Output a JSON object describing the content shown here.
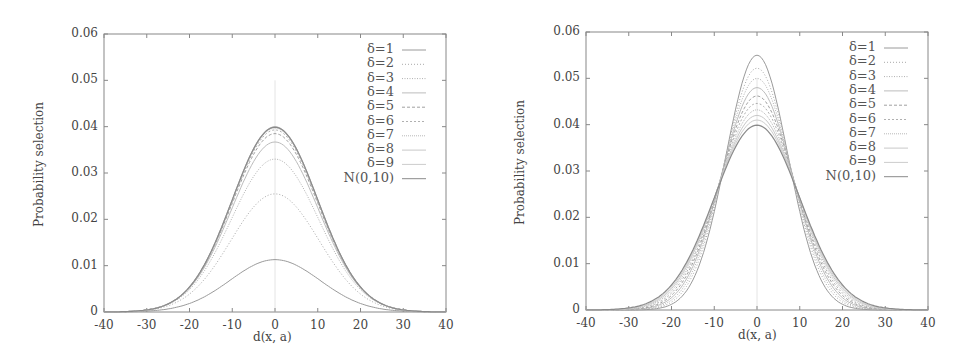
{
  "chart_data": [
    {
      "type": "line",
      "title": "",
      "xlabel": "d(x, a)",
      "ylabel": "Probability selection",
      "xlim": [
        -40,
        40
      ],
      "ylim": [
        0,
        0.06
      ],
      "xticks": [
        "-40",
        "-30",
        "-20",
        "-10",
        "0",
        "10",
        "20",
        "30",
        "40"
      ],
      "yticks": [
        "0",
        "0.01",
        "0.02",
        "0.03",
        "0.04",
        "0.05",
        "0.06"
      ],
      "grid": false,
      "legend_position": "top-right",
      "series": [
        {
          "name": "δ=1",
          "peak": 0.0113,
          "sigma": 10.5,
          "dash": ""
        },
        {
          "name": "δ=2",
          "peak": 0.0255,
          "sigma": 10.3,
          "dash": "1,2"
        },
        {
          "name": "δ=3",
          "peak": 0.033,
          "sigma": 10.2,
          "dash": "1,1.5"
        },
        {
          "name": "δ=4",
          "peak": 0.0367,
          "sigma": 10.1,
          "dash": ""
        },
        {
          "name": "δ=5",
          "peak": 0.0385,
          "sigma": 10.05,
          "dash": "3,2"
        },
        {
          "name": "δ=6",
          "peak": 0.0393,
          "sigma": 10.0,
          "dash": "2,2"
        },
        {
          "name": "δ=7",
          "peak": 0.0397,
          "sigma": 10.0,
          "dash": "1,1"
        },
        {
          "name": "δ=8",
          "peak": 0.0399,
          "sigma": 10.0,
          "dash": ""
        },
        {
          "name": "δ=9",
          "peak": 0.04,
          "sigma": 10.0,
          "dash": ""
        },
        {
          "name": "N(0,10)",
          "peak": 0.0399,
          "sigma": 10.0,
          "dash": ""
        }
      ]
    },
    {
      "type": "line",
      "title": "",
      "xlabel": "d(x, a)",
      "ylabel": "Probability selection",
      "xlim": [
        -40,
        40
      ],
      "ylim": [
        0,
        0.06
      ],
      "xticks": [
        "-40",
        "-30",
        "-20",
        "-10",
        "0",
        "10",
        "20",
        "30",
        "40"
      ],
      "yticks": [
        "0",
        "0.01",
        "0.02",
        "0.03",
        "0.04",
        "0.05",
        "0.06"
      ],
      "grid": false,
      "legend_position": "top-right",
      "series": [
        {
          "name": "δ=1",
          "peak": 0.055,
          "sigma": 7.25,
          "dash": ""
        },
        {
          "name": "δ=2",
          "peak": 0.0522,
          "sigma": 7.65,
          "dash": "1,2"
        },
        {
          "name": "δ=3",
          "peak": 0.05,
          "sigma": 7.98,
          "dash": "1,1.5"
        },
        {
          "name": "δ=4",
          "peak": 0.048,
          "sigma": 8.31,
          "dash": ""
        },
        {
          "name": "δ=5",
          "peak": 0.0462,
          "sigma": 8.63,
          "dash": "3,2"
        },
        {
          "name": "δ=6",
          "peak": 0.0446,
          "sigma": 8.94,
          "dash": "2,2"
        },
        {
          "name": "δ=7",
          "peak": 0.0432,
          "sigma": 9.23,
          "dash": "1,1"
        },
        {
          "name": "δ=8",
          "peak": 0.042,
          "sigma": 9.5,
          "dash": ""
        },
        {
          "name": "δ=9",
          "peak": 0.041,
          "sigma": 9.73,
          "dash": ""
        },
        {
          "name": "N(0,10)",
          "peak": 0.0399,
          "sigma": 10.0,
          "dash": ""
        }
      ]
    }
  ],
  "panels": [
    {
      "ylabel": "Probability selection",
      "xlabel": "d(x, a)",
      "legend": [
        "δ=1",
        "δ=2",
        "δ=3",
        "δ=4",
        "δ=5",
        "δ=6",
        "δ=7",
        "δ=8",
        "δ=9",
        "N(0,10)"
      ]
    },
    {
      "ylabel": "Probability selection",
      "xlabel": "d(x, a)",
      "legend": [
        "δ=1",
        "δ=2",
        "δ=3",
        "δ=4",
        "δ=5",
        "δ=6",
        "δ=7",
        "δ=8",
        "δ=9",
        "N(0,10)"
      ]
    }
  ],
  "colors": {
    "axis": "#888888",
    "curve_dark": "#777777",
    "curve_light": "#b5b5b5",
    "text": "#444444"
  }
}
